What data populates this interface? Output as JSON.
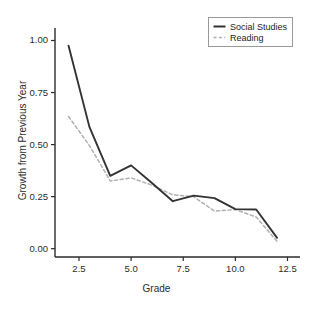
{
  "chart_data": {
    "type": "line",
    "title": "",
    "xlabel": "Grade",
    "ylabel": "Growth from Previous Year",
    "xlim": [
      1.35,
      13.1
    ],
    "ylim": [
      -0.04,
      1.06
    ],
    "xticks": [
      2.5,
      5.0,
      7.5,
      10.0,
      12.5
    ],
    "xtick_labels": [
      "2.5",
      "5.0",
      "7.5",
      "10.0",
      "12.5"
    ],
    "yticks": [
      0.0,
      0.25,
      0.5,
      0.75,
      1.0
    ],
    "ytick_labels": [
      "0.00",
      "0.25",
      "0.50",
      "0.75",
      "1.00"
    ],
    "grid": false,
    "legend_position": "upper right",
    "x": [
      2,
      3,
      4,
      5,
      6,
      7,
      8,
      9,
      10,
      11,
      12
    ],
    "series": [
      {
        "name": "Social Studies",
        "style": "solid",
        "color": "#333333",
        "values": [
          0.975,
          0.585,
          0.35,
          0.4,
          0.315,
          0.228,
          0.255,
          0.243,
          0.19,
          0.188,
          0.052
        ]
      },
      {
        "name": "Reading",
        "style": "dashed",
        "color": "#b0b0b0",
        "values": [
          0.635,
          0.495,
          0.325,
          0.34,
          0.305,
          0.258,
          0.25,
          0.18,
          0.188,
          0.152,
          0.035
        ]
      }
    ]
  },
  "legend": {
    "entries": [
      {
        "label": "Social Studies"
      },
      {
        "label": "Reading"
      }
    ]
  },
  "axes": {
    "x_title": "Grade",
    "y_title": "Growth from Previous Year"
  },
  "colors": {
    "background": "#ffffff",
    "axis": "#2b2b2b",
    "social_studies": "#333333",
    "reading": "#b0b0b0",
    "legend_border": "#9a9a9a"
  }
}
